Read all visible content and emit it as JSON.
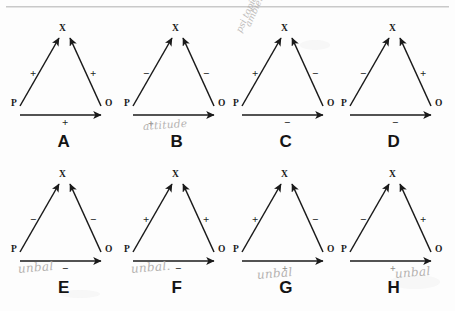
{
  "figure": {
    "node_labels": {
      "p": "P",
      "o": "O",
      "x": "X"
    }
  },
  "panels": [
    {
      "letter": "A",
      "p": "P",
      "o": "O",
      "x": "X",
      "sign_left": "+",
      "sign_right": "+",
      "sign_bottom": "+",
      "annotation": "",
      "pencil_plus": ""
    },
    {
      "letter": "B",
      "p": "P",
      "o": "O",
      "x": "X",
      "sign_left": "−",
      "sign_right": "−",
      "sign_bottom": "",
      "annotation": "attitude",
      "pencil_plus": "+"
    },
    {
      "letter": "C",
      "p": "P",
      "o": "O",
      "x": "X",
      "sign_left": "+",
      "sign_right": "−",
      "sign_bottom": "−",
      "annotation": "",
      "pencil_plus": ""
    },
    {
      "letter": "D",
      "p": "P",
      "o": "O",
      "x": "X",
      "sign_left": "−",
      "sign_right": "+",
      "sign_bottom": "−",
      "annotation": "",
      "pencil_plus": ""
    },
    {
      "letter": "E",
      "p": "P",
      "o": "O",
      "x": "X",
      "sign_left": "−",
      "sign_right": "−",
      "sign_bottom": "−",
      "annotation": "unbal",
      "pencil_plus": ""
    },
    {
      "letter": "F",
      "p": "P",
      "o": "O",
      "x": "X",
      "sign_left": "+",
      "sign_right": "+",
      "sign_bottom": "−",
      "annotation": "unbal.",
      "pencil_plus": ""
    },
    {
      "letter": "G",
      "p": "P",
      "o": "O",
      "x": "X",
      "sign_left": "+",
      "sign_right": "−",
      "sign_bottom": "",
      "annotation": "unbal",
      "pencil_plus": "+"
    },
    {
      "letter": "H",
      "p": "P",
      "o": "O",
      "x": "X",
      "sign_left": "−",
      "sign_right": "+",
      "sign_bottom": "",
      "annotation": "unbal",
      "pencil_plus": "+"
    }
  ],
  "margin_note": {
    "line1": "ambient",
    "line2": "psi topic"
  },
  "colors": {
    "ink": "#1a1a1a",
    "pencil": "#a9a6a4",
    "paper": "#fdfdfd"
  }
}
